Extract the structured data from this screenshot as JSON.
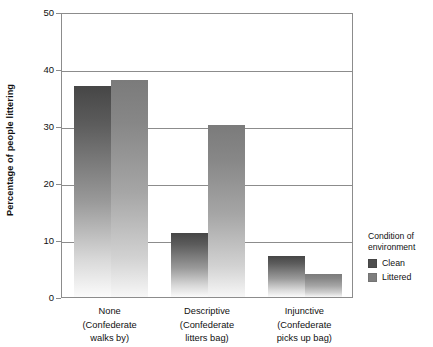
{
  "chart_data": {
    "type": "bar",
    "title": "",
    "xlabel": "",
    "ylabel": "Percentage of people littering",
    "ylim": [
      0,
      50
    ],
    "yticks": [
      0,
      10,
      20,
      30,
      40,
      50
    ],
    "ytick_labels": [
      "0",
      "10",
      "20",
      "30",
      "40",
      "50"
    ],
    "grid": true,
    "legend_position": "right",
    "legend_title": "Condition of environment",
    "categories": [
      {
        "line1": "None",
        "line2": "(Confederate",
        "line3": "walks by)"
      },
      {
        "line1": "Descriptive",
        "line2": "(Confederate",
        "line3": "litters bag)"
      },
      {
        "line1": "Injunctive",
        "line2": "(Confederate",
        "line3": "picks up bag)"
      }
    ],
    "category_labels": [
      "None",
      "Descriptive",
      "Injunctive"
    ],
    "series": [
      {
        "name": "Clean",
        "color": "#4d4d4d",
        "values": [
          37,
          11.2,
          7.2
        ]
      },
      {
        "name": "Littered",
        "color": "#7e7e7e",
        "values": [
          38,
          30.2,
          4.1
        ]
      }
    ]
  },
  "legend": {
    "title_line1": "Condition of",
    "title_line2": "environment",
    "items": [
      {
        "label": "Clean"
      },
      {
        "label": "Littered"
      }
    ]
  },
  "axes": {
    "y_title": "Percentage of people littering"
  }
}
